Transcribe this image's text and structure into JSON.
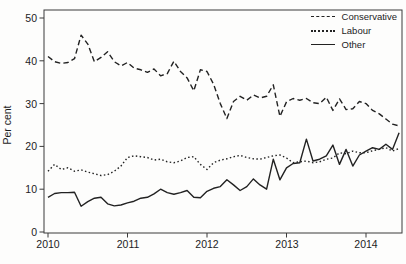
{
  "chart_data": {
    "type": "line",
    "title": "",
    "xlabel": "",
    "ylabel": "Per cent",
    "ylim": [
      0,
      50
    ],
    "yticks": [
      0,
      10,
      20,
      30,
      40,
      50
    ],
    "xtick_labels": [
      "2010",
      "2011",
      "2012",
      "2013",
      "2014"
    ],
    "xtick_month_index": [
      0,
      12,
      24,
      36,
      48
    ],
    "x_start": "2010-01",
    "x_interval": "monthly",
    "n_points": 54,
    "grid": false,
    "frame": "full-box",
    "legend_position": "top-right-inside",
    "line_color": "#222222",
    "series": [
      {
        "name": "Conservative",
        "line_style": "dashed",
        "values": [
          41.0,
          39.8,
          39.4,
          39.6,
          40.5,
          46.0,
          43.9,
          39.8,
          40.8,
          42.1,
          39.8,
          38.8,
          39.6,
          38.3,
          37.9,
          37.3,
          38.1,
          36.5,
          37.0,
          39.9,
          37.5,
          36.0,
          33.0,
          37.9,
          37.5,
          34.5,
          30.0,
          26.5,
          30.5,
          31.7,
          30.8,
          32.0,
          31.3,
          31.7,
          34.4,
          27.0,
          30.4,
          31.2,
          30.8,
          31.2,
          30.2,
          30.0,
          31.5,
          28.4,
          31.1,
          28.6,
          28.8,
          30.5,
          30.0,
          28.4,
          27.6,
          26.4,
          25.2,
          24.8
        ]
      },
      {
        "name": "Labour",
        "line_style": "dotted",
        "values": [
          14.2,
          15.8,
          14.6,
          15.0,
          14.2,
          14.5,
          14.0,
          13.6,
          13.2,
          13.4,
          14.2,
          15.4,
          17.4,
          17.8,
          17.6,
          17.4,
          16.8,
          17.0,
          16.4,
          16.2,
          16.6,
          17.4,
          17.6,
          15.8,
          14.6,
          16.2,
          16.8,
          17.1,
          17.6,
          17.9,
          17.4,
          17.1,
          17.0,
          17.4,
          17.8,
          18.0,
          17.3,
          16.2,
          16.4,
          16.6,
          16.2,
          16.4,
          17.0,
          17.3,
          18.5,
          18.3,
          18.9,
          18.5,
          18.5,
          19.0,
          19.3,
          19.7,
          18.9,
          19.5
        ]
      },
      {
        "name": "Other",
        "line_style": "solid",
        "values": [
          8.1,
          9.0,
          9.2,
          9.2,
          9.3,
          6.0,
          7.1,
          7.9,
          8.1,
          6.6,
          6.1,
          6.3,
          6.8,
          7.2,
          7.9,
          8.1,
          8.9,
          10.0,
          9.2,
          8.8,
          9.2,
          9.7,
          8.1,
          8.0,
          9.5,
          10.2,
          10.6,
          12.2,
          11.0,
          9.7,
          10.6,
          12.4,
          11.0,
          10.0,
          17.0,
          12.2,
          15.0,
          16.0,
          16.2,
          21.7,
          16.6,
          17.0,
          17.8,
          20.3,
          15.8,
          19.3,
          15.4,
          18.0,
          18.9,
          19.7,
          19.3,
          20.5,
          19.3,
          23.2
        ]
      }
    ]
  }
}
